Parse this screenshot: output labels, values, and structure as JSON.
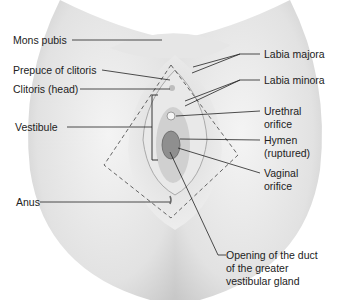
{
  "figure": {
    "labels_left": {
      "mons_pubis": "Mons pubis",
      "prepuce_of_clitoris": "Prepuce of clitoris",
      "clitoris_head": "Clitoris (head)",
      "vestibule": "Vestibule",
      "anus": "Anus"
    },
    "labels_right": {
      "labia_majora": "Labia majora",
      "labia_minora": "Labia minora",
      "urethral_orifice_1": "Urethral",
      "urethral_orifice_2": "orifice",
      "hymen_1": "Hymen",
      "hymen_2": "(ruptured)",
      "vaginal_orifice_1": "Vaginal",
      "vaginal_orifice_2": "orifice"
    },
    "labels_bottom": {
      "duct_1": "Opening of the duct",
      "duct_2": "of the greater",
      "duct_3": "vestibular gland"
    },
    "colors": {
      "skin_light": "#f2f2f2",
      "skin_shade": "#cfcfcf",
      "line": "#222222",
      "dash": "#555555"
    }
  }
}
